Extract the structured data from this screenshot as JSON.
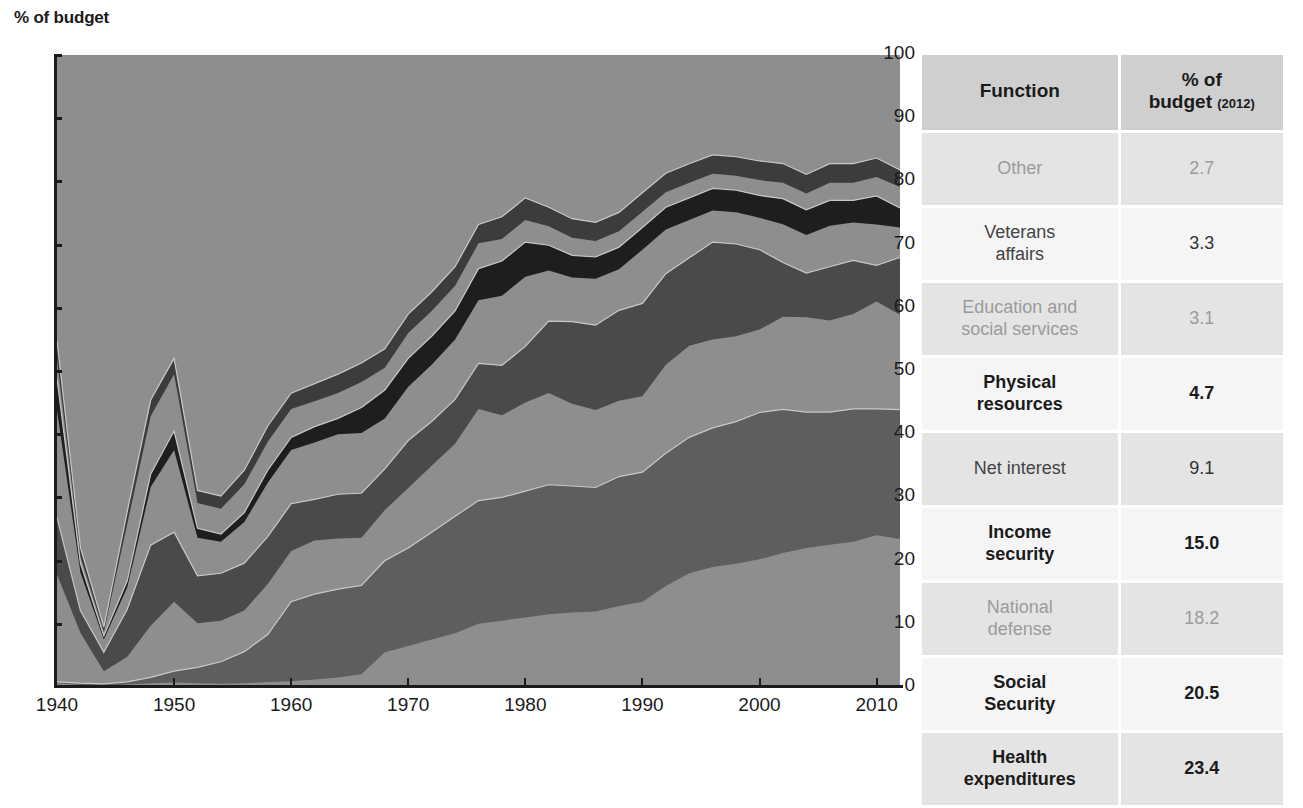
{
  "chart_data": {
    "type": "area",
    "title": "",
    "ylabel": "% of budget",
    "xlabel": "",
    "ylim": [
      0,
      100
    ],
    "xlim": [
      1940,
      2012
    ],
    "stacked": true,
    "normalized_percent": true,
    "grid": false,
    "legend_position": "table-right",
    "ytick_labels": [
      "0",
      "10",
      "20",
      "30",
      "40",
      "50",
      "60",
      "70",
      "80",
      "90",
      "100"
    ],
    "ytick_values": [
      0,
      10,
      20,
      30,
      40,
      50,
      60,
      70,
      80,
      90,
      100
    ],
    "xtick_labels": [
      "1940",
      "1950",
      "1960",
      "1970",
      "1980",
      "1990",
      "2000",
      "2010"
    ],
    "xtick_values": [
      1940,
      1950,
      1960,
      1970,
      1980,
      1990,
      2000,
      2010
    ],
    "x": [
      1940,
      1942,
      1944,
      1946,
      1948,
      1950,
      1952,
      1954,
      1956,
      1958,
      1960,
      1962,
      1964,
      1966,
      1968,
      1970,
      1972,
      1974,
      1976,
      1978,
      1980,
      1982,
      1984,
      1986,
      1988,
      1990,
      1992,
      1994,
      1996,
      1998,
      2000,
      2002,
      2004,
      2006,
      2008,
      2010,
      2012
    ],
    "series": [
      {
        "name": "Health expenditures",
        "color": "#8e8e8e",
        "values": [
          0.6,
          0.3,
          0.2,
          0.4,
          0.6,
          0.7,
          0.6,
          0.5,
          0.6,
          0.8,
          0.9,
          1.2,
          1.5,
          2.0,
          5.5,
          6.5,
          7.5,
          8.5,
          10.0,
          10.5,
          11.0,
          11.5,
          11.8,
          12.2,
          12.8,
          13.5,
          16.0,
          18.0,
          19.0,
          19.5,
          20.0,
          21.0,
          22.0,
          22.5,
          23.0,
          24.0,
          23.4
        ]
      },
      {
        "name": "Social Security",
        "color": "#5e5e5e",
        "values": [
          0.2,
          0.3,
          0.3,
          0.4,
          0.9,
          1.8,
          2.5,
          3.5,
          5.0,
          7.5,
          12.6,
          13.5,
          14.0,
          14.0,
          14.5,
          15.5,
          17.0,
          18.5,
          19.5,
          19.5,
          20.0,
          20.5,
          20.0,
          20.0,
          20.5,
          20.5,
          21.0,
          21.5,
          22.0,
          22.5,
          23.0,
          22.5,
          21.5,
          21.0,
          21.0,
          20.0,
          20.5
        ]
      },
      {
        "name": "Income security",
        "color": "#8e8e8e",
        "values": [
          17.0,
          8.0,
          2.0,
          4.0,
          8.0,
          11.0,
          7.0,
          6.5,
          6.5,
          8.0,
          8.0,
          8.5,
          8.0,
          7.5,
          8.0,
          9.5,
          10.5,
          11.5,
          14.5,
          13.0,
          14.0,
          14.5,
          13.0,
          12.5,
          12.0,
          12.0,
          14.0,
          14.5,
          14.0,
          13.5,
          13.0,
          14.5,
          15.0,
          14.5,
          15.0,
          17.0,
          15.0
        ]
      },
      {
        "name": "Net interest",
        "color": "#4a4a4a",
        "values": [
          9.0,
          3.5,
          3.0,
          7.5,
          12.5,
          11.0,
          7.5,
          7.5,
          7.5,
          7.5,
          7.5,
          6.5,
          7.0,
          7.0,
          6.5,
          7.5,
          7.0,
          7.0,
          7.2,
          7.9,
          8.9,
          11.4,
          13.0,
          13.7,
          14.3,
          14.7,
          14.4,
          13.9,
          15.4,
          14.6,
          12.5,
          8.5,
          7.0,
          8.5,
          8.5,
          5.7,
          9.1
        ]
      },
      {
        "name": "Physical resources",
        "color": "#8e8e8e",
        "values": [
          17.0,
          6.0,
          2.0,
          3.5,
          9.0,
          13.0,
          6.0,
          5.0,
          6.5,
          8.5,
          8.5,
          9.0,
          9.5,
          9.5,
          8.0,
          8.5,
          9.0,
          9.5,
          10.0,
          11.0,
          11.0,
          8.0,
          7.0,
          7.5,
          6.5,
          8.5,
          7.0,
          6.0,
          5.0,
          5.0,
          5.0,
          6.0,
          6.0,
          6.5,
          6.0,
          6.5,
          4.7
        ]
      },
      {
        "name": "Education and social services",
        "color": "#1e1e1e",
        "values": [
          5.0,
          1.5,
          0.6,
          1.0,
          2.0,
          3.0,
          1.5,
          1.2,
          1.5,
          2.0,
          2.0,
          2.5,
          2.5,
          4.0,
          4.5,
          4.5,
          4.5,
          4.5,
          5.0,
          5.5,
          5.5,
          4.0,
          3.5,
          3.5,
          3.5,
          3.5,
          3.5,
          3.5,
          3.5,
          3.5,
          3.5,
          4.0,
          4.0,
          4.0,
          3.5,
          4.5,
          3.1
        ]
      },
      {
        "name": "Veterans affairs",
        "color": "#8e8e8e",
        "values": [
          3.0,
          1.0,
          0.6,
          9.0,
          9.0,
          9.0,
          4.0,
          4.0,
          4.5,
          4.5,
          4.5,
          4.0,
          4.0,
          4.0,
          3.5,
          4.0,
          4.0,
          4.0,
          4.0,
          3.5,
          3.5,
          3.0,
          2.8,
          2.6,
          2.5,
          2.5,
          2.4,
          2.4,
          2.3,
          2.3,
          2.4,
          2.5,
          2.6,
          2.8,
          2.8,
          3.0,
          3.3
        ]
      },
      {
        "name": "Other",
        "color": "#3c3c3c",
        "values": [
          3.0,
          1.5,
          0.8,
          2.0,
          2.5,
          2.5,
          2.0,
          2.0,
          2.2,
          2.5,
          2.5,
          2.8,
          3.0,
          3.0,
          3.0,
          3.0,
          3.0,
          3.0,
          3.0,
          3.5,
          3.5,
          3.0,
          3.0,
          3.0,
          3.0,
          3.0,
          3.0,
          3.0,
          3.0,
          3.0,
          3.0,
          3.0,
          3.0,
          3.0,
          3.0,
          3.0,
          2.7
        ]
      },
      {
        "name": "National defense",
        "color": "#8e8e8e",
        "values": [
          45.2,
          77.9,
          90.5,
          72.2,
          53.5,
          48.0,
          68.9,
          69.8,
          65.7,
          58.7,
          53.5,
          52.0,
          50.5,
          48.5,
          46.5,
          41.0,
          37.5,
          33.5,
          26.8,
          25.6,
          22.6,
          24.1,
          25.9,
          27.0,
          24.9,
          21.8,
          18.7,
          17.2,
          15.8,
          16.1,
          16.6,
          17.0,
          18.9,
          17.2,
          17.2,
          16.3,
          18.2
        ]
      }
    ]
  },
  "y_axis_title": "% of budget",
  "table": {
    "header": {
      "function": "Function",
      "pct_main": "% of",
      "pct_line2": "budget",
      "pct_year": "(2012)"
    },
    "rows": [
      {
        "function": "Other",
        "pct": "2.7",
        "emphasis": "light",
        "band": "a"
      },
      {
        "function": "Veterans affairs",
        "function_l1": "Veterans",
        "function_l2": "affairs",
        "pct": "3.3",
        "emphasis": "mid",
        "band": "b"
      },
      {
        "function": "Education and social services",
        "function_l1": "Education and",
        "function_l2": "social services",
        "pct": "3.1",
        "emphasis": "light",
        "band": "a"
      },
      {
        "function": "Physical resources",
        "function_l1": "Physical",
        "function_l2": "resources",
        "pct": "4.7",
        "emphasis": "bold",
        "band": "b"
      },
      {
        "function": "Net interest",
        "pct": "9.1",
        "emphasis": "mid",
        "band": "a"
      },
      {
        "function": "Income security",
        "function_l1": "Income",
        "function_l2": "security",
        "pct": "15.0",
        "emphasis": "bold",
        "band": "b"
      },
      {
        "function": "National defense",
        "function_l1": "National",
        "function_l2": "defense",
        "pct": "18.2",
        "emphasis": "light",
        "band": "a"
      },
      {
        "function": "Social Security",
        "function_l1": "Social",
        "function_l2": "Security",
        "pct": "20.5",
        "emphasis": "bold",
        "band": "b"
      },
      {
        "function": "Health expenditures",
        "function_l1": "Health",
        "function_l2": "expenditures",
        "pct": "23.4",
        "emphasis": "bold",
        "band": "a"
      }
    ]
  },
  "colors": {
    "plot_background": "#8e8e8e",
    "axis": "#1b1b1b",
    "table_header_bg": "#cfcfcf",
    "table_band_a": "#e4e4e4",
    "table_band_b": "#f5f5f5",
    "text_dark": "#1b1b1b",
    "text_light": "#9b9b9b"
  }
}
